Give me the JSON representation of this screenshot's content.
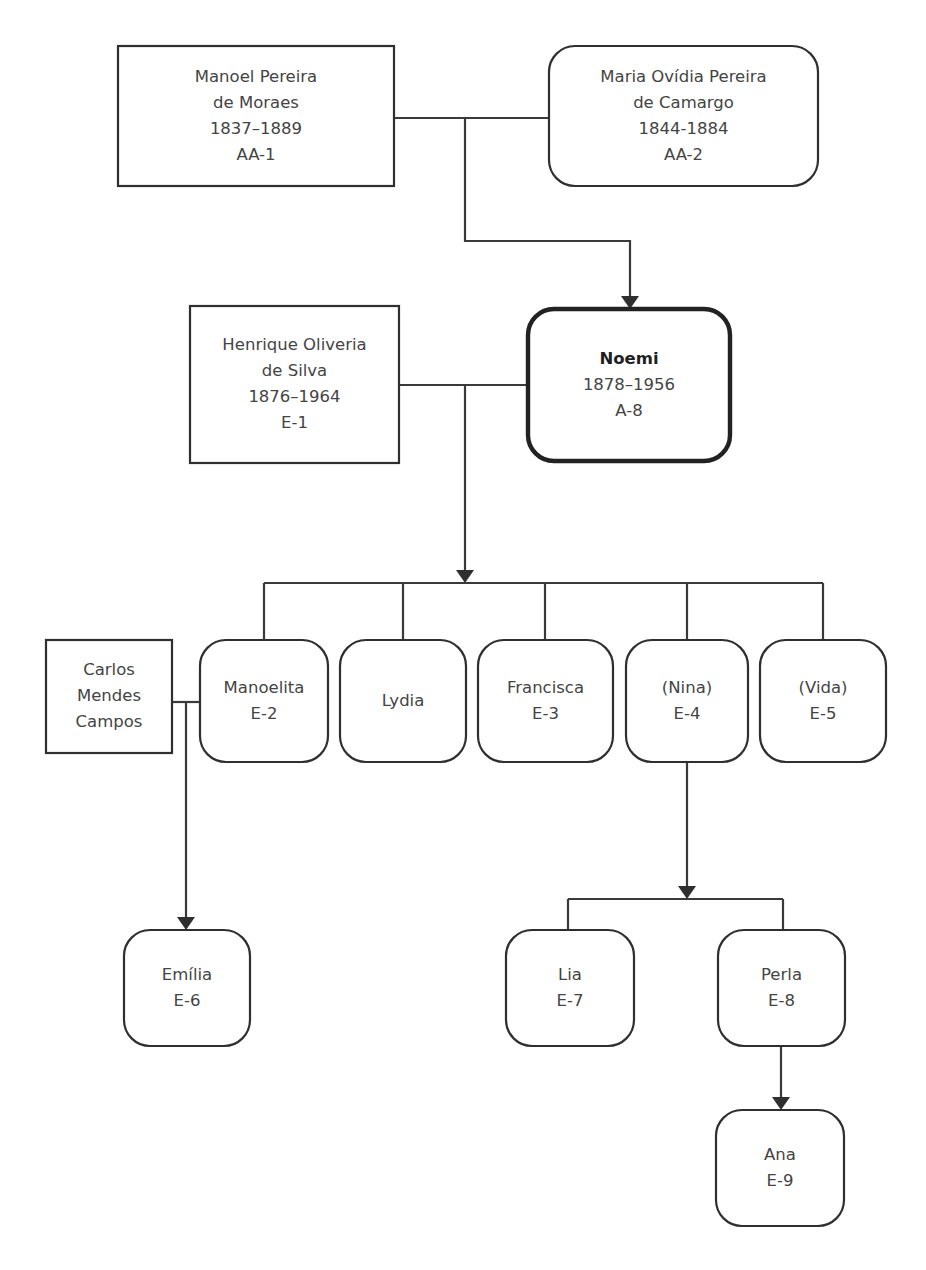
{
  "diagram": {
    "type": "genealogy-tree",
    "stroke_color": "#3a3a3a",
    "text_color": "#444444",
    "background_color": "#ffffff",
    "nodes": [
      {
        "id": "AA-1",
        "name": "manoel-pereira-de-moraes",
        "shape": "rectangle",
        "emphasis": false,
        "x": 118,
        "y": 46,
        "w": 276,
        "h": 140,
        "lines": [
          "Manoel Pereira",
          "de Moraes",
          "1837–1889",
          "AA-1"
        ]
      },
      {
        "id": "AA-2",
        "name": "maria-ovidia-pereira-de-camargo",
        "shape": "rounded",
        "emphasis": false,
        "x": 549,
        "y": 46,
        "w": 269,
        "h": 140,
        "lines": [
          "Maria Ovídia Pereira",
          "de Camargo",
          "1844-1884",
          "AA-2"
        ]
      },
      {
        "id": "E-1",
        "name": "henrique-oliveria-de-silva",
        "shape": "rectangle",
        "emphasis": false,
        "x": 190,
        "y": 306,
        "w": 209,
        "h": 157,
        "lines": [
          "Henrique Oliveria",
          "de Silva",
          "1876–1964",
          "E-1"
        ]
      },
      {
        "id": "A-8",
        "name": "noemi",
        "shape": "rounded",
        "emphasis": true,
        "x": 528,
        "y": 309,
        "w": 202,
        "h": 152,
        "lines": [
          "Noemi",
          "1878–1956",
          "A-8"
        ],
        "bold_first_line": true
      },
      {
        "id": "CMC",
        "name": "carlos-mendes-campos",
        "shape": "rectangle",
        "emphasis": false,
        "x": 46,
        "y": 640,
        "w": 126,
        "h": 113,
        "lines": [
          "Carlos",
          "Mendes",
          "Campos"
        ]
      },
      {
        "id": "E-2",
        "name": "manoelita",
        "shape": "rounded",
        "emphasis": false,
        "x": 200,
        "y": 640,
        "w": 128,
        "h": 122,
        "lines": [
          "Manoelita",
          "E-2"
        ]
      },
      {
        "id": "LYDIA",
        "name": "lydia",
        "shape": "rounded",
        "emphasis": false,
        "x": 340,
        "y": 640,
        "w": 126,
        "h": 122,
        "lines": [
          "Lydia"
        ]
      },
      {
        "id": "E-3",
        "name": "francisca",
        "shape": "rounded",
        "emphasis": false,
        "x": 478,
        "y": 640,
        "w": 135,
        "h": 122,
        "lines": [
          "Francisca",
          "E-3"
        ]
      },
      {
        "id": "E-4",
        "name": "nina",
        "shape": "rounded",
        "emphasis": false,
        "x": 626,
        "y": 640,
        "w": 122,
        "h": 122,
        "lines": [
          "(Nina)",
          "E-4"
        ]
      },
      {
        "id": "E-5",
        "name": "vida",
        "shape": "rounded",
        "emphasis": false,
        "x": 760,
        "y": 640,
        "w": 126,
        "h": 122,
        "lines": [
          "(Vida)",
          "E-5"
        ]
      },
      {
        "id": "E-6",
        "name": "emilia",
        "shape": "rounded",
        "emphasis": false,
        "x": 124,
        "y": 930,
        "w": 126,
        "h": 116,
        "lines": [
          "Emília",
          "E-6"
        ]
      },
      {
        "id": "E-7",
        "name": "lia",
        "shape": "rounded",
        "emphasis": false,
        "x": 506,
        "y": 930,
        "w": 128,
        "h": 116,
        "lines": [
          "Lia",
          "E-7"
        ]
      },
      {
        "id": "E-8",
        "name": "perla",
        "shape": "rounded",
        "emphasis": false,
        "x": 718,
        "y": 930,
        "w": 127,
        "h": 116,
        "lines": [
          "Perla",
          "E-8"
        ]
      },
      {
        "id": "E-9",
        "name": "ana",
        "shape": "rounded",
        "emphasis": false,
        "x": 716,
        "y": 1110,
        "w": 128,
        "h": 116,
        "lines": [
          "Ana",
          "E-9"
        ]
      }
    ],
    "connectors": [
      {
        "name": "marriage-link-aa1-aa2",
        "from": "AA-1",
        "to": "AA-2",
        "path": "M 394 118 L 549 118",
        "arrow": null
      },
      {
        "name": "descent-link-aa-to-noemi",
        "from": "AA-1+AA-2",
        "to": "A-8",
        "path": "M 465 118 L 465 241 L 630 241 L 630 298",
        "arrow": {
          "x": 630,
          "y": 309,
          "dir": "down"
        }
      },
      {
        "name": "marriage-link-e1-noemi",
        "from": "E-1",
        "to": "A-8",
        "path": "M 399 385 L 528 385",
        "arrow": null
      },
      {
        "name": "descent-link-noemi-to-children",
        "from": "E-1+A-8",
        "to": "children-bar",
        "path": "M 465 385 L 465 572",
        "arrow": {
          "x": 465,
          "y": 583,
          "dir": "down"
        }
      },
      {
        "name": "sibling-bar-noemi-children",
        "path": "M 264 583 L 823 583",
        "arrow": null
      },
      {
        "name": "sibling-drop-manoelita",
        "to": "E-2",
        "path": "M 264 583 L 264 640",
        "arrow": null
      },
      {
        "name": "sibling-drop-lydia",
        "to": "LYDIA",
        "path": "M 403 583 L 403 640",
        "arrow": null
      },
      {
        "name": "sibling-drop-francisca",
        "to": "E-3",
        "path": "M 545 583 L 545 640",
        "arrow": null
      },
      {
        "name": "sibling-drop-nina",
        "to": "E-4",
        "path": "M 687 583 L 687 640",
        "arrow": null
      },
      {
        "name": "sibling-drop-vida",
        "to": "E-5",
        "path": "M 823 583 L 823 640",
        "arrow": null
      },
      {
        "name": "marriage-link-carlos-manoelita",
        "from": "CMC",
        "to": "E-2",
        "path": "M 172 702 L 200 702",
        "arrow": null
      },
      {
        "name": "descent-link-carlos-to-emilia",
        "from": "CMC+E-2",
        "to": "E-6",
        "path": "M 186 702 L 186 919",
        "arrow": {
          "x": 186,
          "y": 930,
          "dir": "down"
        }
      },
      {
        "name": "descent-link-nina-to-children",
        "from": "E-4",
        "to": "nina-children-bar",
        "path": "M 687 762 L 687 888",
        "arrow": {
          "x": 687,
          "y": 899,
          "dir": "down"
        }
      },
      {
        "name": "sibling-bar-nina-children",
        "path": "M 568 899 L 783 899",
        "arrow": null
      },
      {
        "name": "sibling-drop-lia",
        "to": "E-7",
        "path": "M 568 899 L 568 930",
        "arrow": null
      },
      {
        "name": "sibling-drop-perla",
        "to": "E-8",
        "path": "M 783 899 L 783 930",
        "arrow": null
      },
      {
        "name": "descent-link-perla-to-ana",
        "from": "E-8",
        "to": "E-9",
        "path": "M 781 1046 L 781 1099",
        "arrow": {
          "x": 781,
          "y": 1110,
          "dir": "down"
        }
      }
    ]
  }
}
